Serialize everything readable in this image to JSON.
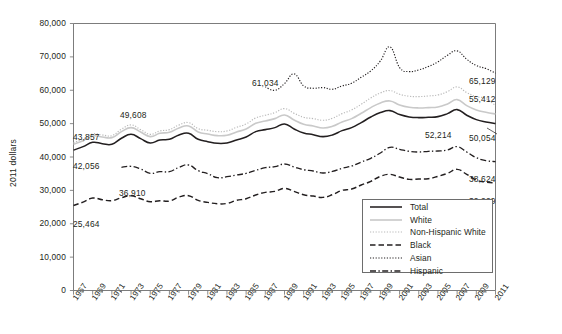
{
  "chart_data": {
    "type": "line",
    "title": "",
    "xlabel": "",
    "ylabel": "2011 dollars",
    "ylim": [
      0,
      80000
    ],
    "ytick_labels": [
      "0",
      "10,000",
      "20,000",
      "30,000",
      "40,000",
      "50,000",
      "60,000",
      "70,000",
      "80,000"
    ],
    "ytick_values": [
      0,
      10000,
      20000,
      30000,
      40000,
      50000,
      60000,
      70000,
      80000
    ],
    "grid": false,
    "legend_position": "lower-right-inside",
    "x": [
      1967,
      1968,
      1969,
      1970,
      1971,
      1972,
      1973,
      1974,
      1975,
      1976,
      1977,
      1978,
      1979,
      1980,
      1981,
      1982,
      1983,
      1984,
      1985,
      1986,
      1987,
      1988,
      1989,
      1990,
      1991,
      1992,
      1993,
      1994,
      1995,
      1996,
      1997,
      1998,
      1999,
      2000,
      2001,
      2002,
      2003,
      2004,
      2005,
      2006,
      2007,
      2008,
      2009,
      2010,
      2011
    ],
    "xtick_labels": [
      "1967",
      "1969",
      "1971",
      "1973",
      "1975",
      "1977",
      "1979",
      "1981",
      "1983",
      "1985",
      "1987",
      "1989",
      "1991",
      "1993",
      "1995",
      "1997",
      "1999",
      "2001",
      "2003",
      "2005",
      "2007",
      "2009",
      "2011"
    ],
    "series": [
      {
        "name": "Total",
        "style": "solid",
        "color": "#231f20",
        "values": [
          42056,
          43100,
          44400,
          44000,
          43800,
          45600,
          46800,
          45500,
          44200,
          45100,
          45300,
          46600,
          47100,
          45300,
          44600,
          44100,
          44200,
          45100,
          46000,
          47600,
          48200,
          48800,
          49900,
          48400,
          47200,
          46700,
          46100,
          46600,
          47900,
          48800,
          50300,
          52000,
          53300,
          53900,
          52700,
          52000,
          51800,
          51900,
          52100,
          53000,
          54200,
          52500,
          51200,
          50500,
          50054
        ]
      },
      {
        "name": "White",
        "style": "solid-light",
        "color": "#c9c9c9",
        "values": [
          43857,
          44900,
          46300,
          46000,
          45800,
          47600,
          48800,
          47500,
          46100,
          47100,
          47400,
          48700,
          49300,
          47500,
          46900,
          46400,
          46500,
          47500,
          48400,
          50100,
          50800,
          51500,
          52600,
          51100,
          49800,
          49300,
          48700,
          49200,
          50500,
          51500,
          53100,
          54800,
          56200,
          56800,
          55600,
          54900,
          54700,
          54800,
          55000,
          55900,
          57200,
          55400,
          54100,
          53400,
          52900
        ]
      },
      {
        "name": "Non-Hispanic White",
        "style": "dotted-light",
        "color": "#b9b9b9",
        "values": [
          44300,
          45400,
          46900,
          46600,
          46400,
          48300,
          49608,
          48200,
          46800,
          47800,
          48200,
          49600,
          50300,
          48500,
          48000,
          47600,
          47800,
          48900,
          49900,
          51700,
          52500,
          53300,
          54500,
          53100,
          51900,
          51500,
          51000,
          51600,
          53000,
          54100,
          55800,
          57700,
          59200,
          59900,
          58800,
          58200,
          58100,
          58300,
          58600,
          59600,
          61000,
          59300,
          58100,
          57500,
          55412
        ]
      },
      {
        "name": "Black",
        "style": "dashed",
        "color": "#231f20",
        "values": [
          25464,
          26500,
          27700,
          27200,
          26900,
          27800,
          28400,
          27500,
          26600,
          26900,
          26800,
          28000,
          28400,
          27000,
          26400,
          26000,
          26100,
          27000,
          27500,
          28600,
          29400,
          29700,
          30600,
          29700,
          28700,
          28300,
          27900,
          28700,
          30000,
          30400,
          31600,
          32700,
          34200,
          34800,
          34000,
          33300,
          33400,
          33500,
          34200,
          35100,
          36300,
          34800,
          33100,
          32500,
          32229
        ]
      },
      {
        "name": "Asian",
        "style": "dotted",
        "color": "#231f20",
        "values": [
          null,
          null,
          null,
          null,
          null,
          null,
          null,
          null,
          null,
          null,
          null,
          null,
          null,
          null,
          null,
          null,
          null,
          null,
          null,
          null,
          61034,
          60000,
          62000,
          64900,
          61300,
          60600,
          60800,
          60300,
          61300,
          62100,
          63900,
          65800,
          68800,
          73000,
          66800,
          65600,
          66100,
          67100,
          68500,
          70500,
          71800,
          69300,
          67400,
          66500,
          65129
        ]
      },
      {
        "name": "Hispanic",
        "style": "dash-dot",
        "color": "#231f20",
        "values": [
          null,
          null,
          null,
          null,
          null,
          36910,
          37200,
          36400,
          35100,
          35600,
          35600,
          36900,
          37600,
          35900,
          35000,
          33800,
          34100,
          34600,
          35100,
          36000,
          36800,
          37100,
          37900,
          37000,
          36200,
          35800,
          35200,
          35700,
          36600,
          37300,
          38500,
          39600,
          41200,
          42900,
          42300,
          41700,
          41500,
          41700,
          41800,
          42100,
          43100,
          41500,
          39800,
          38900,
          38624
        ]
      }
    ],
    "annotations": [
      {
        "text": "43,857",
        "series": "White",
        "side": "left",
        "x_px": 73,
        "y_px": 132
      },
      {
        "text": "49,608",
        "series": "Non-Hispanic White",
        "side": "left",
        "x_px": 120,
        "y_px": 110
      },
      {
        "text": "42,056",
        "series": "Total",
        "side": "left",
        "x_px": 73,
        "y_px": 161
      },
      {
        "text": "36,910",
        "series": "Hispanic",
        "side": "left",
        "x_px": 119,
        "y_px": 188
      },
      {
        "text": "25,464",
        "series": "Black",
        "side": "left",
        "x_px": 73,
        "y_px": 219
      },
      {
        "text": "61,034",
        "series": "Asian",
        "side": "mid",
        "x_px": 252,
        "y_px": 78
      },
      {
        "text": "65,129",
        "series": "Asian",
        "side": "right",
        "x_px": 504,
        "y_px": 76
      },
      {
        "text": "55,412",
        "series": "Non-Hispanic White",
        "side": "right",
        "x_px": 504,
        "y_px": 94
      },
      {
        "text": "52,214",
        "series": "White",
        "side": "right",
        "x_px": 460,
        "y_px": 130
      },
      {
        "text": "50,054",
        "series": "Total",
        "side": "right",
        "x_px": 504,
        "y_px": 133
      },
      {
        "text": "38,624",
        "series": "Black",
        "side": "right",
        "x_px": 504,
        "y_px": 174
      },
      {
        "text": "32,229",
        "series": "Hispanic",
        "side": "right",
        "x_px": 504,
        "y_px": 196
      }
    ],
    "legend": [
      {
        "label": "Total",
        "style": "solid"
      },
      {
        "label": "White",
        "style": "solid-light"
      },
      {
        "label": "Non-Hispanic White",
        "style": "dotted-light"
      },
      {
        "label": "Black",
        "style": "dashed"
      },
      {
        "label": "Asian",
        "style": "dotted"
      },
      {
        "label": "Hispanic",
        "style": "dash-dot"
      }
    ]
  }
}
